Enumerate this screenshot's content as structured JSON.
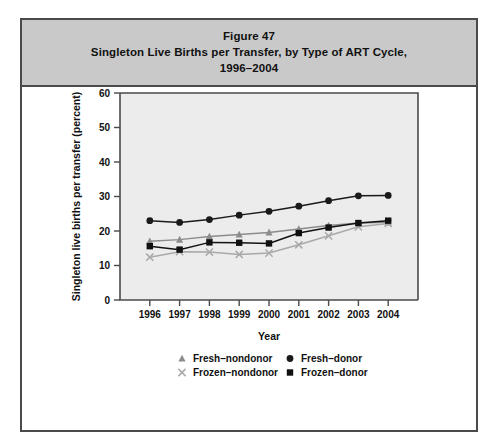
{
  "figure": {
    "title_line1": "Figure 47",
    "title_line2": "Singleton Live Births per Transfer, by Type of ART Cycle,",
    "title_line3": "1996–2004"
  },
  "colors": {
    "title_band": "#c9c9c9",
    "frame_border": "#4a4a4a",
    "plot_background": "#ececec",
    "fresh_nondonor": "#8c8c8c",
    "fresh_donor": "#1a1a1a",
    "frozen_nondonor": "#a9a9a9",
    "frozen_donor": "#111111"
  },
  "chart_data": {
    "type": "line",
    "title": "Singleton Live Births per Transfer, by Type of ART Cycle, 1996–2004",
    "xlabel": "Year",
    "ylabel": "Singleton live births per transfer (percent)",
    "categories": [
      "1996",
      "1997",
      "1998",
      "1999",
      "2000",
      "2001",
      "2002",
      "2003",
      "2004"
    ],
    "x": [
      1996,
      1997,
      1998,
      1999,
      2000,
      2001,
      2002,
      2003,
      2004
    ],
    "ylim": [
      0,
      60
    ],
    "yticks": [
      0,
      10,
      20,
      30,
      40,
      50,
      60
    ],
    "grid": false,
    "legend_position": "below",
    "series": [
      {
        "name": "Fresh–nondonor",
        "marker": "triangle",
        "color": "#8c8c8c",
        "values": [
          17.0,
          17.5,
          18.4,
          19.0,
          19.6,
          20.6,
          21.6,
          22.3,
          22.5
        ]
      },
      {
        "name": "Fresh–donor",
        "marker": "circle",
        "color": "#1a1a1a",
        "values": [
          23.0,
          22.5,
          23.3,
          24.6,
          25.7,
          27.2,
          28.8,
          30.2,
          30.3
        ]
      },
      {
        "name": "Frozen–nondonor",
        "marker": "cross",
        "color": "#a9a9a9",
        "values": [
          12.4,
          14.0,
          13.9,
          13.2,
          13.6,
          16.0,
          18.6,
          21.2,
          22.2
        ]
      },
      {
        "name": "Frozen–donor",
        "marker": "square",
        "color": "#111111",
        "values": [
          15.6,
          14.6,
          16.7,
          16.6,
          16.4,
          19.4,
          21.0,
          22.3,
          23.0
        ]
      }
    ]
  },
  "legend": [
    {
      "label": "Fresh–nondonor",
      "marker": "triangle-icon"
    },
    {
      "label": "Fresh–donor",
      "marker": "circle-icon"
    },
    {
      "label": "Frozen–nondonor",
      "marker": "cross-icon"
    },
    {
      "label": "Frozen–donor",
      "marker": "square-icon"
    }
  ]
}
